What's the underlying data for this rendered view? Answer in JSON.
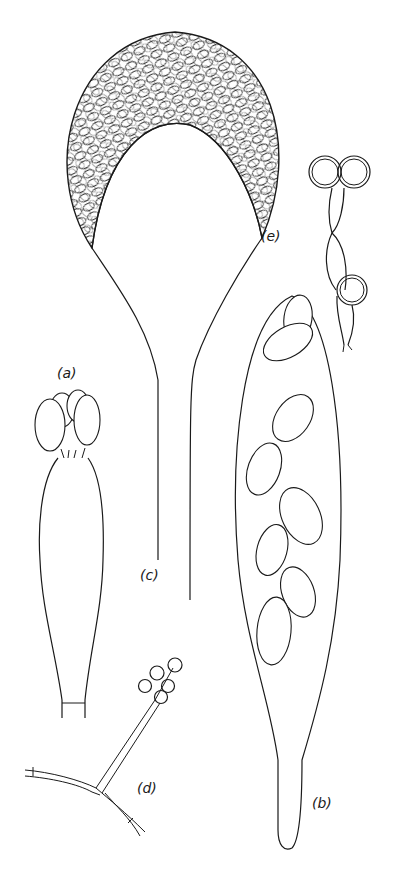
{
  "figure": {
    "panels": [
      {
        "id": "a",
        "label": "(a)",
        "description": "club-shaped basidium-like cell bearing four spores"
      },
      {
        "id": "b",
        "label": "(b)",
        "description": "elongated ascus containing eight elliptical spores"
      },
      {
        "id": "c",
        "label": "(c)",
        "description": "stalked globose sporangium filled with spores"
      },
      {
        "id": "d",
        "label": "(d)",
        "description": "branched hypha with conidiophore bearing spores"
      },
      {
        "id": "e",
        "label": "(e)",
        "description": "chain of cells with thick-walled spherical chlamydospores"
      }
    ],
    "colors": {
      "line": "#1a1a1a",
      "background": "#ffffff"
    }
  }
}
